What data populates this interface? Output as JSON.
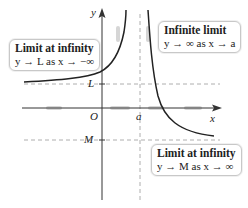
{
  "figure": {
    "type": "limits-illustration",
    "axes": {
      "x_label": "x",
      "y_label": "y",
      "origin_label": "O"
    },
    "marks": {
      "a": "a",
      "L": "L",
      "M": "M"
    },
    "callouts": [
      {
        "title": "Limit at infinity",
        "subtitle": "y → L as x → −∞"
      },
      {
        "title": "Infinite limit",
        "subtitle": "y → ∞ as x → a"
      },
      {
        "title": "Limit at infinity",
        "subtitle": "y → M as x → ∞"
      }
    ],
    "colors": {
      "curve": "#222222",
      "axis": "#333333",
      "dashed": "#999999",
      "arrow_hint": "#cfcfcf",
      "callout_border": "#c8c8c8"
    }
  }
}
